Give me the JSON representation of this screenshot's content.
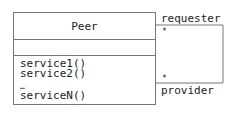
{
  "diagram": {
    "type": "uml-class",
    "class": {
      "name": "Peer",
      "attributes": [],
      "operations": [
        "service1()",
        "service2()",
        "…",
        "serviceN()"
      ]
    },
    "association": {
      "kind": "self-association",
      "end_top": {
        "role": "requester",
        "multiplicity": "*"
      },
      "end_bottom": {
        "role": "provider",
        "multiplicity": "*"
      }
    },
    "colors": {
      "line": "#777777",
      "text": "#222222"
    }
  }
}
